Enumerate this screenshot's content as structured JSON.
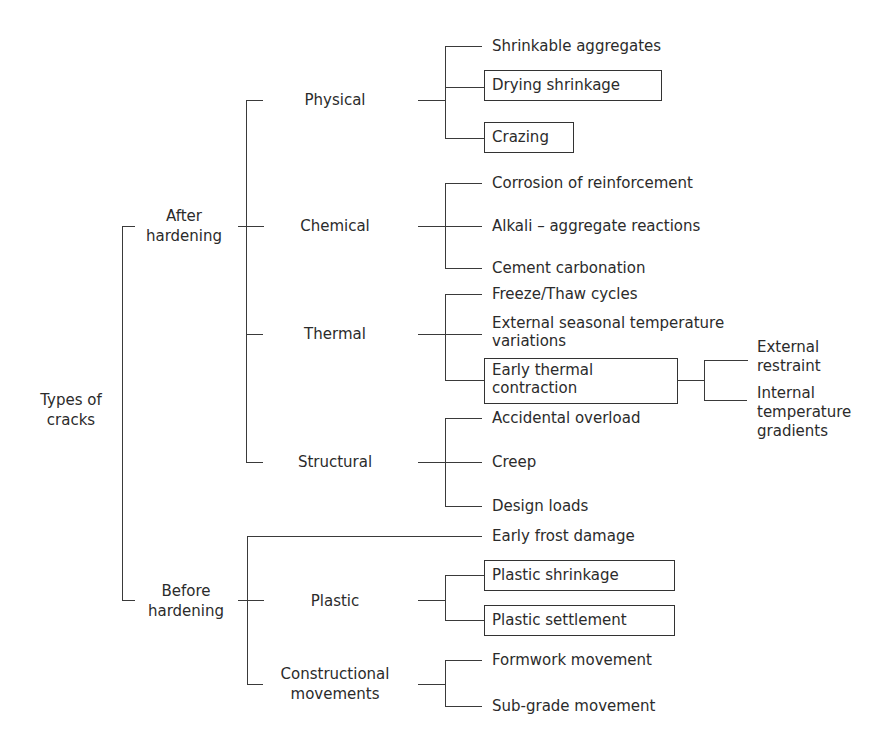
{
  "diagram": {
    "root": {
      "label_line1": "Types of",
      "label_line2": "cracks"
    },
    "after_hardening": {
      "label_line1": "After",
      "label_line2": "hardening",
      "categories": {
        "physical": {
          "label": "Physical",
          "items": [
            {
              "label": "Shrinkable aggregates",
              "boxed": false
            },
            {
              "label": "Drying shrinkage",
              "boxed": true
            },
            {
              "label": "Crazing",
              "boxed": true
            }
          ]
        },
        "chemical": {
          "label": "Chemical",
          "items": [
            {
              "label": "Corrosion of reinforcement",
              "boxed": false
            },
            {
              "label": "Alkali – aggregate reactions",
              "boxed": false
            },
            {
              "label": "Cement carbonation",
              "boxed": false
            }
          ]
        },
        "thermal": {
          "label": "Thermal",
          "items": [
            {
              "label": "Freeze/Thaw cycles",
              "boxed": false
            },
            {
              "label_line1": "External seasonal temperature",
              "label_line2": "variations",
              "boxed": false
            },
            {
              "label_line1": "Early thermal",
              "label_line2": "contraction",
              "boxed": true,
              "subitems": [
                {
                  "label_line1": "External",
                  "label_line2": "restraint"
                },
                {
                  "label_line1": "Internal",
                  "label_line2": "temperature",
                  "label_line3": "gradients"
                }
              ]
            }
          ]
        },
        "structural": {
          "label": "Structural",
          "items": [
            {
              "label": "Accidental overload",
              "boxed": false
            },
            {
              "label": "Creep",
              "boxed": false
            },
            {
              "label": "Design loads",
              "boxed": false
            }
          ]
        }
      }
    },
    "before_hardening": {
      "label_line1": "Before",
      "label_line2": "hardening",
      "direct_item": {
        "label": "Early frost damage",
        "boxed": false
      },
      "categories": {
        "plastic": {
          "label": "Plastic",
          "items": [
            {
              "label": "Plastic shrinkage",
              "boxed": true
            },
            {
              "label": "Plastic settlement",
              "boxed": true
            }
          ]
        },
        "constructional": {
          "label_line1": "Constructional",
          "label_line2": "movements",
          "items": [
            {
              "label": "Formwork movement",
              "boxed": false
            },
            {
              "label": "Sub-grade movement",
              "boxed": false
            }
          ]
        }
      }
    },
    "colors": {
      "line": "#3a3a3a",
      "text": "#2b2b2b",
      "background": "#ffffff"
    }
  }
}
